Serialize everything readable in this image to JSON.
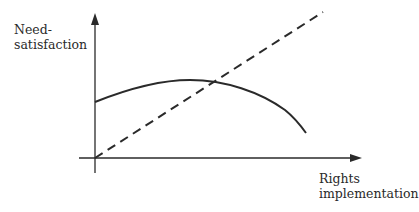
{
  "diagram": {
    "y_axis_label_line1": "Need-",
    "y_axis_label_line2": "satisfaction",
    "x_axis_label_line1": "Rights",
    "x_axis_label_line2": "implementation",
    "line_color": "#2a2a2a",
    "series": [
      {
        "name": "solid-curve",
        "style": "solid",
        "shape": "concave arch: starts mid-height, rises to a gentle peak, then falls steeply"
      },
      {
        "name": "dashed-line",
        "style": "dashed",
        "shape": "straight line rising from origin"
      }
    ]
  }
}
